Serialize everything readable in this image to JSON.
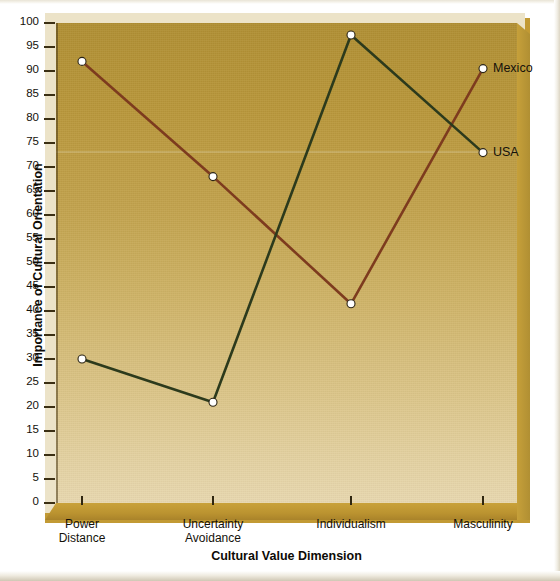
{
  "chart_data": {
    "type": "line",
    "title": "",
    "xlabel": "Cultural Value Dimension",
    "ylabel": "Importance of Cultural Orientation",
    "categories": [
      "Power Distance",
      "Uncertainty Avoidance",
      "Individualism",
      "Masculinity"
    ],
    "category_lines": [
      [
        "Power",
        "Distance"
      ],
      [
        "Uncertainty",
        "Avoidance"
      ],
      [
        "Individualism",
        ""
      ],
      [
        "Masculinity",
        ""
      ]
    ],
    "ylim": [
      0,
      100
    ],
    "ytick_step": 5,
    "yticks": [
      0,
      5,
      10,
      15,
      20,
      25,
      30,
      35,
      40,
      45,
      50,
      55,
      60,
      65,
      70,
      75,
      80,
      85,
      90,
      95,
      100
    ],
    "grid": false,
    "legend_position": "inline-right-endpoint",
    "series": [
      {
        "name": "Mexico",
        "color": "#7d3b1e",
        "marker": "white-filled-circle",
        "values": [
          92,
          68,
          41.5,
          90.5
        ]
      },
      {
        "name": "USA",
        "color": "#2c3a1c",
        "marker": "white-filled-circle",
        "values": [
          30,
          21,
          97.5,
          73
        ]
      }
    ]
  },
  "axes": {
    "y_title": "Importance of Cultural Orientation",
    "x_title": "Cultural Value Dimension",
    "y_tick_labels": [
      "100",
      "95",
      "90",
      "85",
      "80",
      "75",
      "70",
      "65",
      "60",
      "55",
      "50",
      "45",
      "40",
      "35",
      "30",
      "25",
      "20",
      "15",
      "10",
      "5",
      "0"
    ]
  },
  "legend": {
    "items": [
      {
        "label": "Mexico",
        "color": "#7d3b1e"
      },
      {
        "label": "USA",
        "color": "#2c3a1c"
      }
    ]
  },
  "colors": {
    "plot_background_top": "#b08f33",
    "plot_background_bottom": "#e8d8af",
    "mat": "#ece3c8",
    "base_3d": "#c29a34",
    "mexico_line": "#7d3b1e",
    "usa_line": "#2c3a1c",
    "marker_fill": "#ffffff",
    "text": "#14110a",
    "page_background": "#ffffff"
  }
}
